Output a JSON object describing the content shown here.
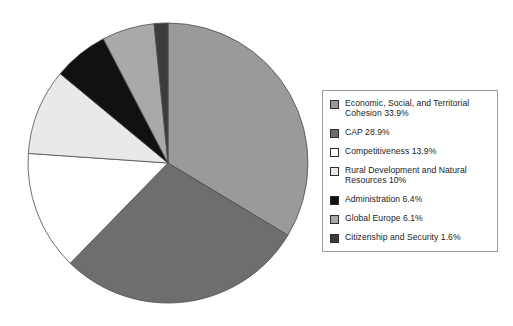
{
  "chart_data": {
    "type": "pie",
    "title": "",
    "subtitle": "",
    "xlabel": "",
    "ylabel": "",
    "grid": false,
    "legend_position": "right",
    "start_angle_deg": 0,
    "direction": "clockwise",
    "categories": [
      "Economic, Social, and Territorial Cohesion",
      "CAP",
      "Competitiveness",
      "Rural Development and Natural Resources",
      "Administration",
      "Global Europe",
      "Citizenship and Security"
    ],
    "values": [
      33.9,
      28.9,
      13.9,
      10,
      6.4,
      6.1,
      1.6
    ],
    "value_unit": "%",
    "colors": [
      "#9a9a9a",
      "#6e6e6e",
      "#ffffff",
      "#e9e9e9",
      "#111111",
      "#a9a9a9",
      "#3c3c3c"
    ],
    "slice_edge_color": "#4d4d4d"
  },
  "legend": {
    "items": [
      {
        "label": "Economic, Social, and Territorial\nCohesion 33.9%",
        "name": "Economic, Social, and Territorial Cohesion",
        "value": "33.9%",
        "color": "#9a9a9a",
        "swatch_icon": "legend-swatch-icon"
      },
      {
        "label": "CAP 28.9%",
        "name": "CAP",
        "value": "28.9%",
        "color": "#6e6e6e",
        "swatch_icon": "legend-swatch-icon"
      },
      {
        "label": "Competitiveness 13.9%",
        "name": "Competitiveness",
        "value": "13.9%",
        "color": "#ffffff",
        "swatch_icon": "legend-swatch-icon"
      },
      {
        "label": "Rural Development and Natural\nResources 10%",
        "name": "Rural Development and Natural Resources",
        "value": "10%",
        "color": "#e9e9e9",
        "swatch_icon": "legend-swatch-icon"
      },
      {
        "label": "Administration  6.4%",
        "name": "Administration",
        "value": "6.4%",
        "color": "#111111",
        "swatch_icon": "legend-swatch-icon"
      },
      {
        "label": "Global Europe 6.1%",
        "name": "Global Europe",
        "value": "6.1%",
        "color": "#a9a9a9",
        "swatch_icon": "legend-swatch-icon"
      },
      {
        "label": "Citizenship and Security 1.6%",
        "name": "Citizenship and Security",
        "value": "1.6%",
        "color": "#3c3c3c",
        "swatch_icon": "legend-swatch-icon"
      }
    ]
  },
  "pie_geometry": {
    "center_x": 168,
    "center_y": 163,
    "radius": 140
  }
}
